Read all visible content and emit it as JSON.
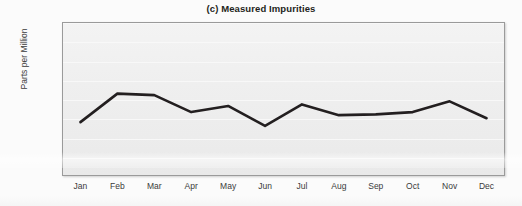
{
  "chart_data": {
    "type": "line",
    "title": "(c) Measured Impurities",
    "xlabel": "",
    "ylabel": "Parts per Million",
    "categories": [
      "Jan",
      "Feb",
      "Mar",
      "Apr",
      "May",
      "Jun",
      "Jul",
      "Aug",
      "Sep",
      "Oct",
      "Nov",
      "Dec"
    ],
    "values": [
      70,
      107,
      105,
      83,
      91,
      65,
      93,
      79,
      80,
      83,
      97,
      75
    ],
    "series": [
      {
        "name": "Measured Impurities",
        "values": [
          70,
          107,
          105,
          83,
          91,
          65,
          93,
          79,
          80,
          83,
          97,
          75
        ]
      }
    ],
    "ylim": [
      0,
      200
    ],
    "yticks": [
      0,
      25,
      50,
      75,
      100,
      125,
      150,
      175,
      200
    ],
    "ytick_labels": [
      "0",
      "25",
      "50",
      "75",
      "100",
      "125",
      "150",
      "175",
      "200"
    ],
    "grid": true,
    "legend": "none",
    "line_color": "#231f20",
    "plot_background": "#efefef",
    "axis_color": "#9a9a9a"
  }
}
